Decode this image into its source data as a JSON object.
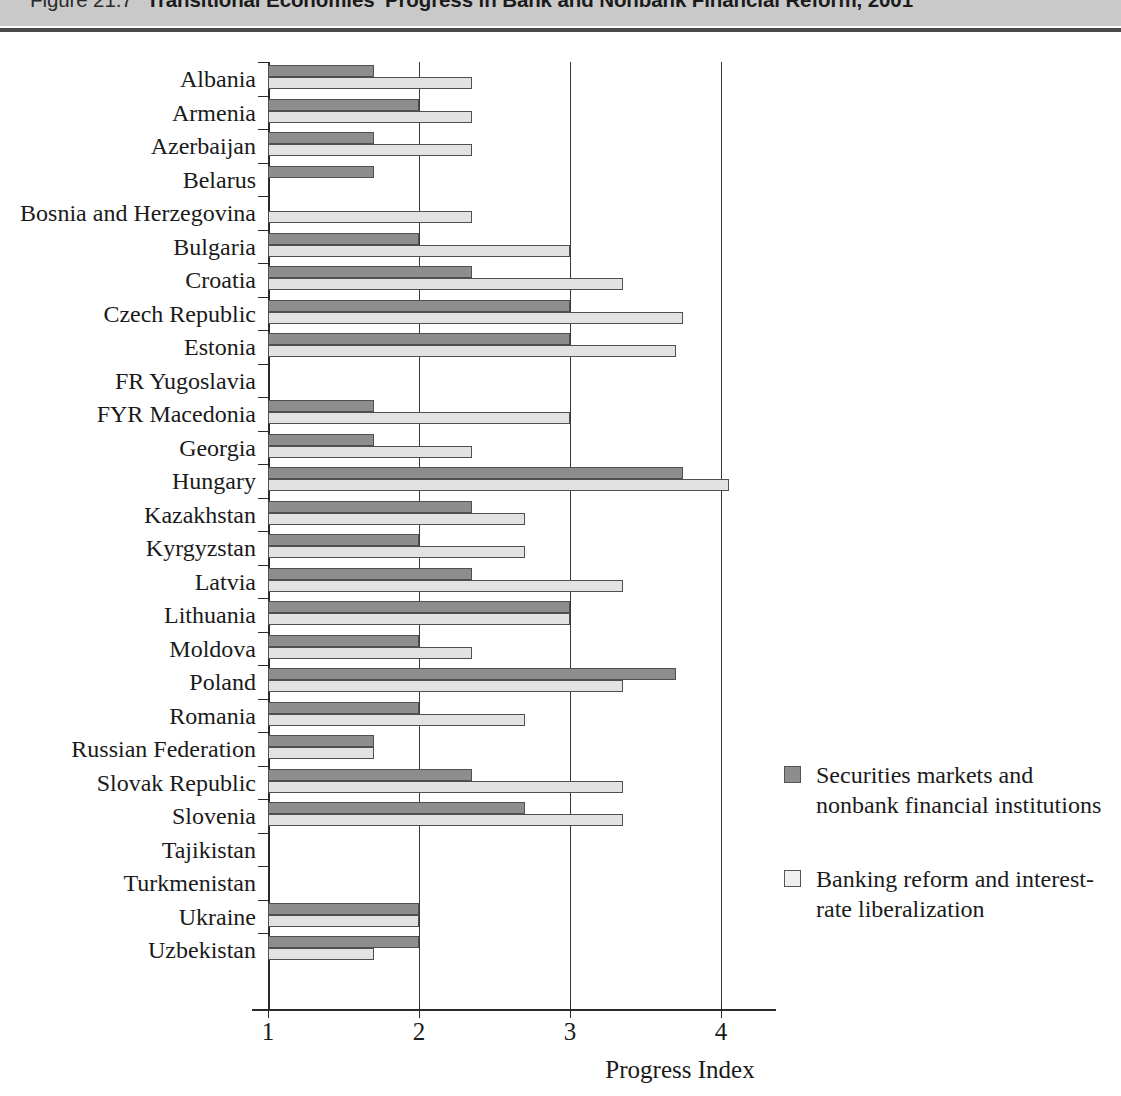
{
  "header": {
    "figure_number": "Figure 21.7",
    "title": "Transitional Economies' Progress in Bank and Nonbank Financial Reform, 2001"
  },
  "legend": {
    "items": [
      {
        "swatch": "dark-gray-swatch-icon",
        "label": "Securities markets and nonbank financial institutions",
        "color": "#8d8d8d"
      },
      {
        "swatch": "light-gray-swatch-icon",
        "label": "Banking reform and interest-rate liberalization",
        "color": "#efefef"
      }
    ]
  },
  "axis": {
    "x_title": "Progress Index",
    "x_ticks": [
      "1",
      "2",
      "3",
      "4"
    ]
  },
  "chart_data": {
    "type": "bar",
    "orientation": "horizontal",
    "title": "Transitional Economies' Progress in Bank and Nonbank Financial Reform, 2001",
    "xlabel": "Progress Index",
    "ylabel": "",
    "xlim": [
      1,
      4.3
    ],
    "grid": true,
    "legend_position": "right",
    "categories": [
      "Albania",
      "Armenia",
      "Azerbaijan",
      "Belarus",
      "Bosnia and Herzegovina",
      "Bulgaria",
      "Croatia",
      "Czech Republic",
      "Estonia",
      "FR Yugoslavia",
      "FYR Macedonia",
      "Georgia",
      "Hungary",
      "Kazakhstan",
      "Kyrgyzstan",
      "Latvia",
      "Lithuania",
      "Moldova",
      "Poland",
      "Romania",
      "Russian Federation",
      "Slovak Republic",
      "Slovenia",
      "Tajikistan",
      "Turkmenistan",
      "Ukraine",
      "Uzbekistan"
    ],
    "series": [
      {
        "name": "Securities markets and nonbank financial institutions",
        "color": "#8d8d8d",
        "values": [
          1.7,
          2.0,
          1.7,
          1.7,
          1.0,
          2.0,
          2.35,
          3.0,
          3.0,
          1.0,
          1.7,
          1.7,
          3.75,
          2.35,
          2.0,
          2.35,
          3.0,
          2.0,
          3.7,
          2.0,
          1.7,
          2.35,
          2.7,
          1.0,
          1.0,
          2.0,
          2.0
        ]
      },
      {
        "name": "Banking reform and interest-rate liberalization",
        "color": "#e2e2e2",
        "values": [
          2.35,
          2.35,
          2.35,
          1.0,
          2.35,
          3.0,
          3.35,
          3.75,
          3.7,
          1.0,
          3.0,
          2.35,
          4.05,
          2.7,
          2.7,
          3.35,
          3.0,
          2.35,
          3.35,
          2.7,
          1.7,
          3.35,
          3.35,
          1.0,
          1.0,
          2.0,
          1.7
        ]
      }
    ]
  }
}
